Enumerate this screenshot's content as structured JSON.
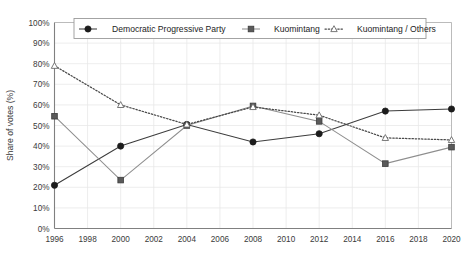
{
  "chart_data": {
    "type": "line",
    "title": "",
    "xlabel": "",
    "ylabel": "Share of votes (%)",
    "x": [
      1996,
      2000,
      2004,
      2008,
      2012,
      2016,
      2020
    ],
    "xlim": [
      1996,
      2020
    ],
    "ylim": [
      0,
      100
    ],
    "xticks": [
      "1996",
      "1998",
      "2000",
      "2002",
      "2004",
      "2006",
      "2008",
      "2010",
      "2012",
      "2014",
      "2016",
      "2018",
      "2020"
    ],
    "xtick_values": [
      1996,
      1998,
      2000,
      2002,
      2004,
      2006,
      2008,
      2010,
      2012,
      2014,
      2016,
      2018,
      2020
    ],
    "yticks": [
      "0%",
      "10%",
      "20%",
      "30%",
      "40%",
      "50%",
      "60%",
      "70%",
      "80%",
      "90%",
      "100%"
    ],
    "ytick_values": [
      0,
      10,
      20,
      30,
      40,
      50,
      60,
      70,
      80,
      90,
      100
    ],
    "grid": true,
    "legend_position": "top-center",
    "series": [
      {
        "name": "Democratic Progressive Party",
        "marker": "filled-circle",
        "linestyle": "solid",
        "color": "#1c1c1c",
        "values": [
          21,
          40,
          50.5,
          42,
          46,
          57,
          58
        ]
      },
      {
        "name": "Kuomintang",
        "marker": "filled-square",
        "linestyle": "solid",
        "color": "#8e8e8e",
        "values": [
          54.5,
          23.5,
          50,
          59.5,
          52,
          31.5,
          39.5
        ]
      },
      {
        "name": "Kuomintang / Others",
        "marker": "open-triangle",
        "linestyle": "dotted",
        "color": "#4a4a4a",
        "values": [
          79,
          60,
          50.5,
          59,
          55,
          44,
          43
        ]
      }
    ]
  },
  "legend": {
    "items": [
      {
        "label": "Democratic Progressive Party"
      },
      {
        "label": "Kuomintang"
      },
      {
        "label": "Kuomintang / Others"
      }
    ]
  },
  "axes": {
    "y_axis_title": "Share of votes (%)"
  }
}
